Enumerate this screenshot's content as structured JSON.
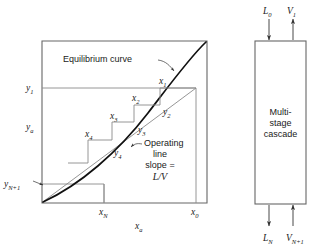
{
  "figure": {
    "colors": {
      "frame": "#666666",
      "equilibrium_curve": "#111111",
      "operating_line": "#7a7a7a",
      "steps": "#8a8a8a",
      "arrow": "#333333",
      "text": "#1a1a1a",
      "background": "#ffffff"
    }
  },
  "plot": {
    "y_axis_labels": [
      {
        "id": "y1",
        "base": "y",
        "sub": "1"
      },
      {
        "id": "ya",
        "base": "y",
        "sub": "a"
      },
      {
        "id": "yN1",
        "base": "y",
        "sub": "N+1"
      }
    ],
    "x_axis_labels": [
      {
        "id": "xN",
        "base": "x",
        "sub": "N"
      },
      {
        "id": "xa",
        "base": "x",
        "sub": "a"
      },
      {
        "id": "x0",
        "base": "x",
        "sub": "0"
      }
    ],
    "stage_labels": [
      {
        "id": "x1",
        "base": "x",
        "sub": "1"
      },
      {
        "id": "x2",
        "base": "x",
        "sub": "2"
      },
      {
        "id": "x3",
        "base": "x",
        "sub": "3"
      },
      {
        "id": "x4",
        "base": "x",
        "sub": "4"
      },
      {
        "id": "y2",
        "base": "y",
        "sub": "2"
      },
      {
        "id": "y3",
        "base": "y",
        "sub": "3"
      },
      {
        "id": "y4",
        "base": "y",
        "sub": "4"
      }
    ],
    "annotations": {
      "equilibrium_curve": "Equilibrium curve",
      "operating_line_line1": "Operating",
      "operating_line_line2": "line",
      "operating_line_line3": "slope =",
      "operating_line_line4": "L/V"
    }
  },
  "cascade": {
    "box_text_line1": "Multi-",
    "box_text_line2": "stage",
    "box_text_line3": "cascade",
    "streams": [
      {
        "id": "L0",
        "base": "L",
        "sub": "0",
        "direction": "in-top"
      },
      {
        "id": "V1",
        "base": "V",
        "sub": "1",
        "direction": "out-top"
      },
      {
        "id": "LN",
        "base": "L",
        "sub": "N",
        "direction": "out-bottom"
      },
      {
        "id": "VN1",
        "base": "V",
        "sub": "N+1",
        "direction": "in-bottom"
      }
    ]
  }
}
